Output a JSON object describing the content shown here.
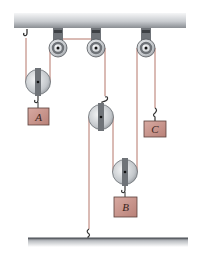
{
  "diagram": {
    "type": "pulley-system",
    "colors": {
      "rope": "#b5776a",
      "block_fill": "#c9978f",
      "block_stroke": "#5a3f3a",
      "pulley_disc": "#c8ccd0",
      "pulley_strap": "#6f7378",
      "ceiling_top": "#f2f3f4",
      "ceiling_bottom": "#8e9296",
      "floor_line": "#4d5156"
    },
    "blocks": [
      {
        "id": "A",
        "label": "A"
      },
      {
        "id": "B",
        "label": "B"
      },
      {
        "id": "C",
        "label": "C"
      }
    ],
    "fixed_pulleys": 3,
    "movable_pulleys": 3,
    "supports": [
      "ceiling",
      "floor"
    ]
  }
}
